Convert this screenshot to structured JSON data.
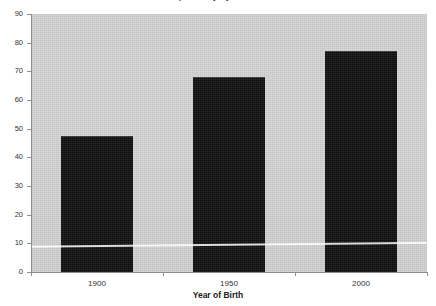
{
  "chart_data": {
    "type": "bar",
    "title": "Life Expectancy by Year of Birth",
    "title_cropped": true,
    "categories": [
      "1900",
      "1950",
      "2000"
    ],
    "values": [
      47.5,
      68,
      77
    ],
    "xlabel": "Year of Birth",
    "ylabel": "",
    "ylim": [
      0,
      90
    ],
    "ytick_labels": [
      "0",
      "10",
      "20",
      "30",
      "40",
      "50",
      "60",
      "70",
      "80",
      "90"
    ],
    "ytick_values": [
      0,
      10,
      20,
      30,
      40,
      50,
      60,
      70,
      80,
      90
    ],
    "grid": false,
    "legend": null,
    "bar_color": "#131313",
    "plot_background": "#d5d5d5",
    "axis_color": "#8d8d8d"
  },
  "annotations": {
    "scan_streak": "horizontal light scan artifact near value 9"
  }
}
